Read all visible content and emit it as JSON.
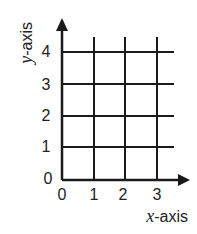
{
  "diagram": {
    "type": "coordinate-grid",
    "x_axis": {
      "variable": "x",
      "suffix": "-axis",
      "ticks": [
        "0",
        "1",
        "2",
        "3"
      ]
    },
    "y_axis": {
      "variable": "y",
      "suffix": "-axis",
      "ticks": [
        "0",
        "1",
        "2",
        "3",
        "4"
      ]
    },
    "grid": {
      "columns": 3,
      "rows": 4
    },
    "colors": {
      "line": "#1a1a1a",
      "text": "#222222",
      "background": "#ffffff"
    }
  }
}
